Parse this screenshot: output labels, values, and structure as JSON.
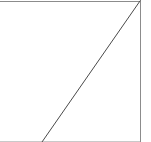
{
  "figure": {
    "title": "",
    "background_color": "#ffffff",
    "width": 151,
    "height": 142,
    "description": "Cropped plot region: white panel with a gray top border, a gray right border, a faint gray bottom border, and a single dark diagonal line rising from lower-left to the upper-right corner."
  },
  "axes": {
    "top_spine": {
      "name": "top-spine",
      "visible": true,
      "color": "#8c8c8c",
      "x1": 0,
      "y1": 1.5,
      "x2": 140,
      "y2": 1.5,
      "width": 1
    },
    "right_spine": {
      "name": "right-spine",
      "visible": true,
      "color": "#8c8c8c",
      "x1": 140.5,
      "y1": 0,
      "x2": 140.5,
      "y2": 142,
      "width": 1
    },
    "bottom_spine": {
      "name": "bottom-spine",
      "visible": true,
      "color": "#c9c9c9",
      "x1": 0,
      "y1": 141.5,
      "x2": 140,
      "y2": 141.5,
      "width": 1
    },
    "left_spine": {
      "name": "left-spine",
      "visible": false
    },
    "grid": false,
    "tick_labels_x": [],
    "tick_labels_y": []
  },
  "chart_data": {
    "type": "line",
    "title": "",
    "subtitle": "",
    "xlabel": "",
    "ylabel": "",
    "grid": false,
    "legend": [],
    "legend_position": "none",
    "annotations": [],
    "xlim": [
      0,
      151
    ],
    "ylim": [
      0,
      142
    ],
    "series": [
      {
        "name": "diagonal-trend",
        "color": "#4a4a4a",
        "line_width": 1,
        "line_style": "solid",
        "marker": "none",
        "x": [
          42,
          140
        ],
        "y": [
          142,
          1
        ],
        "points_px": [
          {
            "x": 42,
            "y": 142
          },
          {
            "x": 140,
            "y": 1
          }
        ],
        "slope_px": -1.439,
        "direction": "increasing"
      }
    ]
  }
}
